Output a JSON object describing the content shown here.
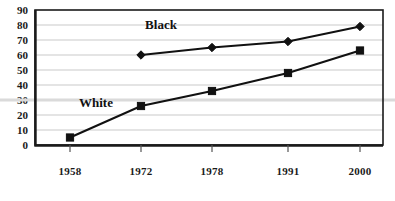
{
  "chart_data": {
    "type": "line",
    "title": "",
    "subtitle": "",
    "xlabel": "",
    "ylabel": "",
    "categories": [
      "1958",
      "1972",
      "1978",
      "1991",
      "2000"
    ],
    "xtick_labels": [
      "1958",
      "1972",
      "1978",
      "1991",
      "2000"
    ],
    "ytick_labels": [
      "0",
      "10",
      "20",
      "30",
      "40",
      "50",
      "60",
      "70",
      "80",
      "90"
    ],
    "ylim": [
      0,
      90
    ],
    "ytick_step": 10,
    "grid": true,
    "grid_axis": "y",
    "legend_position": "inline-labels",
    "series": [
      {
        "name": "Black",
        "label": "Black",
        "marker": "diamond",
        "color": "#111111",
        "x": [
          "1972",
          "1978",
          "1991",
          "2000"
        ],
        "values": [
          60,
          65,
          69,
          79
        ],
        "label_x": "1972",
        "label_value": 78
      },
      {
        "name": "White",
        "label": "White",
        "marker": "square",
        "color": "#111111",
        "x": [
          "1958",
          "1972",
          "1978",
          "1991",
          "2000"
        ],
        "values": [
          5,
          26,
          36,
          48,
          63
        ],
        "label_x": "1958",
        "label_value": 26
      }
    ]
  },
  "colors": {
    "line": "#111111",
    "gridline": "#c9c9c9",
    "axis": "#1a1a1a",
    "background": "#ffffff",
    "text": "#111111"
  },
  "axis": {
    "y_labels": {
      "v0": "0",
      "v10": "10",
      "v20": "20",
      "v30": "30",
      "v40": "40",
      "v50": "50",
      "v60": "60",
      "v70": "70",
      "v80": "80",
      "v90": "90"
    },
    "x_labels": {
      "t0": "1958",
      "t1": "1972",
      "t2": "1978",
      "t3": "1991",
      "t4": "2000"
    }
  },
  "labels": {
    "black": "Black",
    "white": "White"
  }
}
